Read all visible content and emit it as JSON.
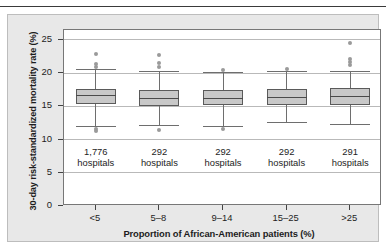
{
  "chart_data": {
    "type": "box",
    "title": "",
    "xlabel": "Proportion of African-American patients (%)",
    "ylabel": "30-day risk-standardized mortality rate (%)",
    "ylim": [
      0,
      26.5
    ],
    "yticks": [
      0,
      5,
      10,
      15,
      20,
      25
    ],
    "ytick_labels": [
      "0",
      "5",
      "10",
      "15",
      "20",
      "25"
    ],
    "grid": true,
    "legend": "none",
    "categories": [
      "<5",
      "5–8",
      "9–14",
      "15–25",
      ">25"
    ],
    "counts": [
      "1,776",
      "292",
      "292",
      "292",
      "291"
    ],
    "count_unit": "hospitals",
    "series": [
      {
        "name": "<5",
        "count": 1776,
        "whisker_low": 12.1,
        "q1": 15.3,
        "median": 16.7,
        "q3": 17.6,
        "whisker_high": 20.6,
        "outliers_high": [
          21.0,
          21.4,
          22.9
        ],
        "outliers_low": [
          11.3,
          11.6
        ]
      },
      {
        "name": "5–8",
        "count": 292,
        "whisker_low": 12.2,
        "q1": 15.1,
        "median": 16.3,
        "q3": 17.4,
        "whisker_high": 20.3,
        "outliers_high": [
          20.9,
          21.6,
          22.7
        ],
        "outliers_low": [
          11.4
        ]
      },
      {
        "name": "9–14",
        "count": 292,
        "whisker_low": 12.1,
        "q1": 15.2,
        "median": 16.3,
        "q3": 17.4,
        "whisker_high": 20.2,
        "outliers_high": [
          20.5
        ],
        "outliers_low": [
          11.6
        ]
      },
      {
        "name": "15–25",
        "count": 292,
        "whisker_low": 12.6,
        "q1": 15.2,
        "median": 16.4,
        "q3": 17.6,
        "whisker_high": 20.3,
        "outliers_high": [
          20.6
        ],
        "outliers_low": []
      },
      {
        "name": ">25",
        "count": 291,
        "whisker_low": 12.4,
        "q1": 15.2,
        "median": 16.6,
        "q3": 17.7,
        "whisker_high": 20.4,
        "outliers_high": [
          21.2,
          21.7,
          22.2,
          24.5
        ],
        "outliers_low": []
      }
    ]
  },
  "colors": {
    "box_fill": "#c8c8c8",
    "box_border": "#5a5a5a",
    "outlier": "#9a9a9a",
    "gridline": "#b9b9b9",
    "panel_background": "#e8e8e8",
    "plot_background": "#ffffff",
    "text": "#1d1d1d"
  }
}
